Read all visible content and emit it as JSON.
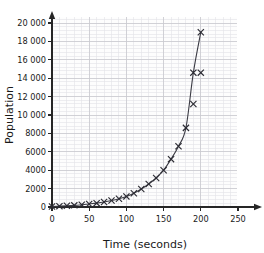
{
  "chart_data": {
    "type": "scatter",
    "title": "",
    "xlabel": "Time (seconds)",
    "ylabel": "Population",
    "xlim": [
      0,
      262
    ],
    "ylim": [
      0,
      20600
    ],
    "xticks": [
      0,
      50,
      100,
      150,
      200,
      250
    ],
    "xtick_labels": [
      "0",
      "50",
      "100",
      "150",
      "200",
      "250"
    ],
    "yticks": [
      0,
      2000,
      4000,
      6000,
      8000,
      10000,
      12000,
      14000,
      16000,
      18000,
      20000
    ],
    "ytick_labels": [
      "0",
      "2000",
      "4000",
      "6000",
      "8000",
      "10 000",
      "12 000",
      "14 000",
      "16 000",
      "18 000",
      "20 000"
    ],
    "grid": true,
    "grid_minor": true,
    "legend": "none",
    "marker": "x",
    "series": [
      {
        "name": "Population over time",
        "x": [
          0,
          10,
          20,
          30,
          40,
          50,
          60,
          70,
          80,
          90,
          100,
          110,
          120,
          130,
          140,
          150,
          160,
          170,
          180,
          190,
          200
        ],
        "y": [
          60,
          90,
          130,
          180,
          250,
          330,
          420,
          540,
          700,
          900,
          1150,
          1500,
          1950,
          2500,
          3150,
          4000,
          5200,
          6600,
          8600,
          11200,
          14600
        ]
      }
    ],
    "curve_points": {
      "x": [
        0,
        10,
        20,
        30,
        40,
        50,
        60,
        70,
        80,
        90,
        100,
        110,
        120,
        130,
        140,
        150,
        160,
        170,
        180,
        190,
        200
      ],
      "y": [
        60,
        90,
        130,
        180,
        250,
        330,
        420,
        540,
        700,
        900,
        1150,
        1500,
        1950,
        2500,
        3150,
        4000,
        5200,
        6600,
        8600,
        11200,
        14600
      ]
    },
    "extra_markers": [
      {
        "x": 190,
        "y": 14600
      },
      {
        "x": 200,
        "y": 19000
      }
    ],
    "colors": {
      "axis": "#262626",
      "grid_major": "#c9c9cf",
      "grid_minor": "#e2e2e8",
      "curve": "#3b3b44",
      "marker": "#2b2b33",
      "plot_background": "#fdfdfd"
    }
  },
  "axis": {
    "x_title": "Time (seconds)",
    "y_title": "Population"
  }
}
